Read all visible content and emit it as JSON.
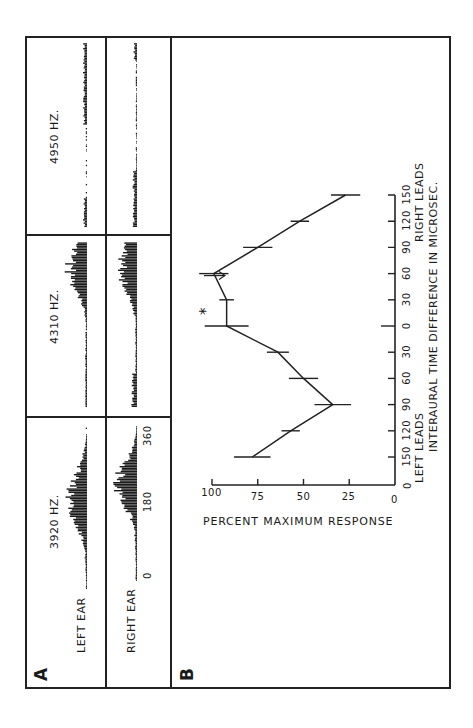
{
  "figure": {
    "panel_a_label": "A",
    "panel_b_label": "B",
    "row_labels": [
      "LEFT EAR",
      "RIGHT EAR"
    ],
    "columns": [
      {
        "frequency": "3920 HZ."
      },
      {
        "frequency": "4310 HZ."
      },
      {
        "frequency": "4950 HZ."
      }
    ],
    "phase_axis_ticks": [
      "0",
      "180",
      "360"
    ]
  },
  "chart_data": {
    "type": "line",
    "title": "",
    "xlabel": "INTERAURAL TIME DIFFERENCE IN MICROSEC.",
    "xlabel_left": "LEFT LEADS",
    "xlabel_right": "RIGHT LEADS",
    "ylabel": "PERCENT MAXIMUM RESPONSE",
    "x_tick_labels": [
      "150",
      "120",
      "90",
      "60",
      "30",
      "0",
      "30",
      "60",
      "90",
      "120",
      "150"
    ],
    "x": [
      -150,
      -120,
      -90,
      -60,
      -30,
      0,
      30,
      60,
      90,
      120,
      150
    ],
    "y_ticks": [
      "0",
      "25",
      "50",
      "75",
      "100"
    ],
    "ylim": [
      0,
      100
    ],
    "series": [
      {
        "name": "response",
        "values": [
          78,
          57,
          34,
          50,
          64,
          92,
          92,
          99,
          75,
          52,
          27
        ],
        "error_bar_halfwidth": [
          10,
          5,
          10,
          8,
          6,
          12,
          4,
          8,
          8,
          5,
          8
        ]
      }
    ],
    "annotation": "*",
    "grid": false,
    "legend": null
  }
}
